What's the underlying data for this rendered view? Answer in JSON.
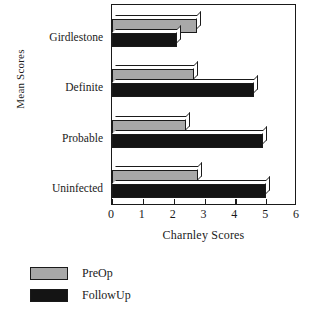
{
  "chart_data": {
    "type": "bar",
    "orientation": "horizontal",
    "title": "",
    "xlabel": "Charnley Scores",
    "ylabel": "Mean Scores",
    "categories": [
      "Girdlestone",
      "Definite",
      "Probable",
      "Uninfected"
    ],
    "series": [
      {
        "name": "PreOp",
        "color": "#a8a8a8",
        "values": [
          2.75,
          2.65,
          2.4,
          2.8
        ]
      },
      {
        "name": "FollowUp",
        "color": "#141414",
        "values": [
          2.1,
          4.6,
          4.9,
          5.0
        ]
      }
    ],
    "xlim": [
      0,
      6
    ],
    "xticks": [
      0,
      1,
      2,
      3,
      4,
      5,
      6
    ],
    "xtick_labels": [
      "0",
      "1",
      "2",
      "3",
      "4",
      "5",
      "6"
    ],
    "grid": false,
    "legend_position": "below-left",
    "frame": true
  },
  "axes": {
    "x_title": "Charnley Scores",
    "y_title": "Mean Scores"
  },
  "legend": {
    "entries": [
      {
        "label": "PreOp",
        "color": "#a8a8a8"
      },
      {
        "label": "FollowUp",
        "color": "#141414"
      }
    ]
  }
}
